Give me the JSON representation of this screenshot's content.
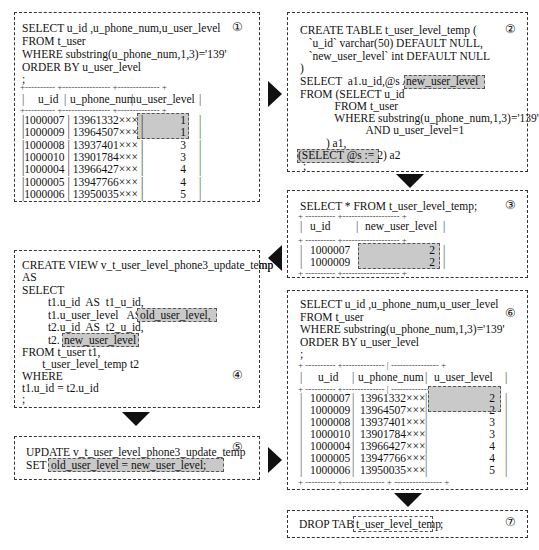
{
  "steps": {
    "s1": {
      "num": "①",
      "sql": [
        "SELECT u_id ,u_phone_num,u_user_level",
        "FROM t_user",
        "WHERE substring(u_phone_num,1,3)='139'",
        "ORDER BY u_user_level",
        ";"
      ],
      "headers": [
        "u_id",
        "u_phone_num",
        "u_user_level"
      ],
      "rows": [
        [
          "1000007",
          "13961332×××",
          "1"
        ],
        [
          "1000009",
          "13964507×××",
          "1"
        ],
        [
          "1000008",
          "13937401×××",
          "3"
        ],
        [
          "1000010",
          "13901784×××",
          "3"
        ],
        [
          "1000004",
          "13966427×××",
          "4"
        ],
        [
          "1000005",
          "13947766×××",
          "4"
        ],
        [
          "1000006",
          "13950035×××",
          "5"
        ]
      ]
    },
    "s2": {
      "num": "②",
      "sql": [
        "CREATE TABLE t_user_level_temp (",
        "   `u_id` varchar(50) DEFAULT NULL,",
        "   `new_user_level` int DEFAULT NULL",
        ")",
        "SELECT  a1.u_id,@s AS",
        "FROM (SELECT u_id",
        "            FROM t_user",
        "            WHERE substring(u_phone_num,1,3)='139'",
        "                       AND u_user_level=1",
        "         ) a1,",
        "(SELECT @s := 2) a2",
        " ;"
      ],
      "highlight_alias": "new_user_level"
    },
    "s3": {
      "num": "③",
      "sql": "SELECT * FROM t_user_level_temp;",
      "headers": [
        "u_id",
        "new_user_level"
      ],
      "rows": [
        [
          "1000007",
          "2"
        ],
        [
          "1000009",
          "2"
        ]
      ]
    },
    "s4": {
      "num": "④",
      "sql": [
        "CREATE VIEW v_t_user_level_phone3_update_temp",
        "AS",
        "SELECT",
        "         t1.u_id  AS  t1_u_id,",
        "         t1.u_user_level   AS",
        "         t2.u_id  AS  t2_u_id,",
        "         t2.",
        "FROM t_user t1,",
        "       t_user_level_temp t2",
        "WHERE",
        "t1.u_id = t2.u_id",
        ";"
      ],
      "highlight_old": "old_user_level,",
      "highlight_new": "new_user_level"
    },
    "s5": {
      "num": "⑤",
      "sql": [
        "UPDATE v_t_user_level_phone3_update_temp",
        "SET"
      ],
      "highlight": "old_user_level = new_user_level;"
    },
    "s6": {
      "num": "⑥",
      "sql": [
        "SELECT u_id ,u_phone_num,u_user_level",
        "FROM t_user",
        "WHERE substring(u_phone_num,1,3)='139'",
        "ORDER BY u_user_level",
        ";"
      ],
      "headers": [
        "u_id",
        "u_phone_num",
        "u_user_level"
      ],
      "rows": [
        [
          "1000007",
          "13961332×××",
          "2"
        ],
        [
          "1000009",
          "13964507×××",
          "2"
        ],
        [
          "1000008",
          "13937401×××",
          "3"
        ],
        [
          "1000010",
          "13901784×××",
          "3"
        ],
        [
          "1000004",
          "13966427×××",
          "4"
        ],
        [
          "1000005",
          "13947766×××",
          "4"
        ],
        [
          "1000006",
          "13950035×××",
          "5"
        ]
      ]
    },
    "s7": {
      "num": "⑦",
      "prefix": "DROP TABLE",
      "table": "t_user_level_temp",
      "suffix": ";"
    }
  },
  "arrows": [
    "right",
    "down",
    "left",
    "down",
    "right",
    "down"
  ]
}
